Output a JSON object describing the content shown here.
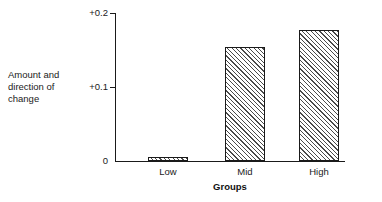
{
  "chart_data": {
    "type": "bar",
    "title": "",
    "subtitle": "",
    "xlabel": "Groups",
    "ylabel": "Amount and\ndirection of\nchange",
    "categories": [
      "Low",
      "Mid",
      "High"
    ],
    "values": [
      0.005,
      0.154,
      0.177
    ],
    "ylim": [
      0,
      0.2
    ],
    "yticks": [
      0,
      0.1,
      0.2
    ],
    "ytick_labels": [
      "0",
      "+0.1",
      "+0.2"
    ],
    "grid": false,
    "legend": null,
    "bar_fill": "diagonal-hatch",
    "bar_edge_color": "#1a1a1a",
    "bar_hatch_color": "#4a4a4a",
    "background_color": "#ffffff",
    "axis_color": "#1a1a1a"
  },
  "axes": {
    "y_caption": "Amount and\ndirection of\nchange",
    "x_title": "Groups",
    "tick_top_label": "+0.2",
    "tick_mid_label": "+0.1",
    "tick_zero_label": "0"
  },
  "bars": [
    {
      "label": "Low",
      "value": 0.005
    },
    {
      "label": "Mid",
      "value": 0.154
    },
    {
      "label": "High",
      "value": 0.177
    }
  ]
}
